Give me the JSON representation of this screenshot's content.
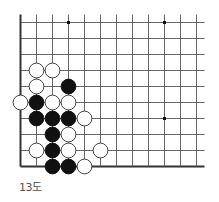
{
  "diagram": {
    "caption": "13도",
    "board": {
      "columns": 12,
      "rows": 10,
      "origin_x": 20.5,
      "origin_y": 22.5,
      "spacing": 16,
      "left_edge": true,
      "bottom_edge": true,
      "line_color": "#555555",
      "edge_color": "#333333"
    },
    "star_points": [
      {
        "col": 3,
        "row": 0
      },
      {
        "col": 9,
        "row": 0
      },
      {
        "col": 9,
        "row": 6
      }
    ],
    "stones": [
      {
        "color": "white",
        "col": 1,
        "row": 3
      },
      {
        "color": "white",
        "col": 2,
        "row": 3
      },
      {
        "color": "white",
        "col": 1,
        "row": 4
      },
      {
        "color": "black",
        "col": 3,
        "row": 4
      },
      {
        "color": "white",
        "col": 0,
        "row": 5
      },
      {
        "color": "black",
        "col": 1,
        "row": 5
      },
      {
        "color": "white",
        "col": 2,
        "row": 5
      },
      {
        "color": "white",
        "col": 3,
        "row": 5
      },
      {
        "color": "black",
        "col": 1,
        "row": 6
      },
      {
        "color": "black",
        "col": 2,
        "row": 6
      },
      {
        "color": "black",
        "col": 3,
        "row": 6
      },
      {
        "color": "white",
        "col": 4,
        "row": 6
      },
      {
        "color": "black",
        "col": 2,
        "row": 7
      },
      {
        "color": "white",
        "col": 3,
        "row": 7
      },
      {
        "color": "white",
        "col": 1,
        "row": 8
      },
      {
        "color": "black",
        "col": 2,
        "row": 8
      },
      {
        "color": "white",
        "col": 3,
        "row": 8
      },
      {
        "color": "white",
        "col": 5,
        "row": 8
      },
      {
        "color": "black",
        "col": 2,
        "row": 9
      },
      {
        "color": "black",
        "col": 3,
        "row": 9
      },
      {
        "color": "white",
        "col": 4,
        "row": 9
      }
    ]
  }
}
